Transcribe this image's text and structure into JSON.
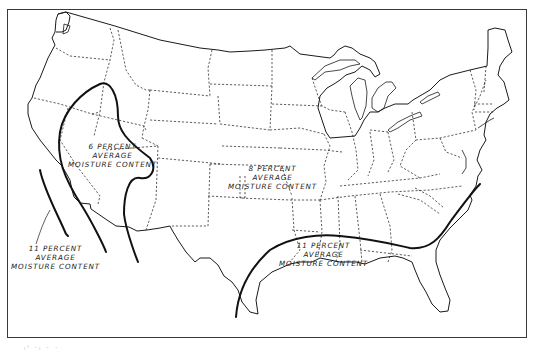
{
  "map": {
    "type": "zone map",
    "region": "Continental United States",
    "style": {
      "line_color": "#1a1a1a",
      "background": "#ffffff",
      "state_border": "dashed",
      "zone_boundary": "thick solid"
    },
    "zones": [
      {
        "id": "zone-6",
        "line1": "6 PERCENT",
        "line2": "AVERAGE",
        "line3": "MOISTURE CONTENT"
      },
      {
        "id": "zone-8",
        "line1": "8 PERCENT",
        "line2": "AVERAGE",
        "line3": "MOISTURE CONTENT"
      },
      {
        "id": "zone-11-west",
        "line1": "11 PERCENT",
        "line2": "AVERAGE",
        "line3": "MOISTURE CONTENT"
      },
      {
        "id": "zone-11-southeast",
        "line1": "11 PERCENT",
        "line2": "AVERAGE",
        "line3": "MOISTURE CONTENT"
      }
    ]
  },
  "caption": "ᵢᴵ ·ᵢ · ·"
}
